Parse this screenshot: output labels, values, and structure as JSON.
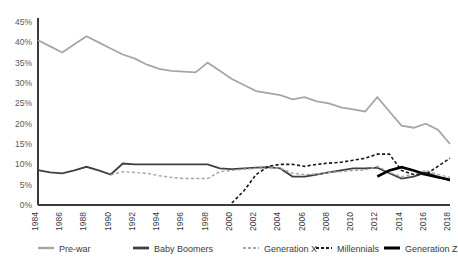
{
  "chart_data": {
    "type": "line",
    "title": "",
    "xlabel": "",
    "ylabel": "",
    "ylim": [
      0,
      45
    ],
    "ytick_labels": [
      "0%",
      "5%",
      "10%",
      "15%",
      "20%",
      "25%",
      "30%",
      "35%",
      "40%",
      "45%"
    ],
    "ytick_values": [
      0,
      5,
      10,
      15,
      20,
      25,
      30,
      35,
      40,
      45
    ],
    "grid": false,
    "legend_position": "bottom",
    "x": [
      1984,
      1985,
      1986,
      1987,
      1988,
      1989,
      1990,
      1991,
      1992,
      1993,
      1994,
      1995,
      1996,
      1997,
      1998,
      1999,
      2000,
      2001,
      2002,
      2003,
      2004,
      2005,
      2006,
      2007,
      2008,
      2009,
      2010,
      2011,
      2012,
      2013,
      2014,
      2015,
      2016,
      2017,
      2018
    ],
    "xtick_labels": [
      "1984",
      "1986",
      "1988",
      "1990",
      "1992",
      "1994",
      "1996",
      "1998",
      "2000",
      "2002",
      "2004",
      "2006",
      "2008",
      "2010",
      "2012",
      "2014",
      "2016",
      "2018"
    ],
    "xtick_values": [
      1984,
      1986,
      1988,
      1990,
      1992,
      1994,
      1996,
      1998,
      2000,
      2002,
      2004,
      2006,
      2008,
      2010,
      2012,
      2014,
      2016,
      2018
    ],
    "series": [
      {
        "name": "Pre-war",
        "color": "#a6a6a6",
        "style": "solid",
        "width": 1.8,
        "x": [
          1984,
          1985,
          1986,
          1987,
          1988,
          1989,
          1990,
          1991,
          1992,
          1993,
          1994,
          1995,
          1996,
          1997,
          1998,
          1999,
          2000,
          2001,
          2002,
          2003,
          2004,
          2005,
          2006,
          2007,
          2008,
          2009,
          2010,
          2011,
          2012,
          2013,
          2014,
          2015,
          2016,
          2017,
          2018
        ],
        "values": [
          40.5,
          39.0,
          37.5,
          39.5,
          41.5,
          40.0,
          38.5,
          37.0,
          36.0,
          34.5,
          33.5,
          33.0,
          32.8,
          32.6,
          35.0,
          33.0,
          31.0,
          29.5,
          28.0,
          27.5,
          27.0,
          26.0,
          26.5,
          25.5,
          25.0,
          24.0,
          23.5,
          23.0,
          26.5,
          23.0,
          19.5,
          19.0,
          20.0,
          18.5,
          15.0
        ]
      },
      {
        "name": "Baby Boomers",
        "color": "#3f3f3f",
        "style": "solid",
        "width": 1.8,
        "x": [
          1984,
          1985,
          1986,
          1987,
          1988,
          1989,
          1990,
          1991,
          1992,
          1993,
          1994,
          1995,
          1996,
          1997,
          1998,
          1999,
          2000,
          2001,
          2002,
          2003,
          2004,
          2005,
          2006,
          2007,
          2008,
          2009,
          2010,
          2011,
          2012,
          2013,
          2014,
          2015,
          2016,
          2017,
          2018
        ],
        "values": [
          8.6,
          8.0,
          7.8,
          8.5,
          9.4,
          8.5,
          7.5,
          10.2,
          10.0,
          10.0,
          10.0,
          10.0,
          10.0,
          10.0,
          10.0,
          9.0,
          8.8,
          9.0,
          9.2,
          9.3,
          9.0,
          7.0,
          7.0,
          7.5,
          8.0,
          8.5,
          9.0,
          9.0,
          9.2,
          7.8,
          6.5,
          7.0,
          8.0,
          7.0,
          6.0
        ]
      },
      {
        "name": "Generation X",
        "color": "#a6a6a6",
        "style": "dashed",
        "width": 1.4,
        "x": [
          1990,
          1991,
          1992,
          1993,
          1994,
          1995,
          1996,
          1997,
          1998,
          1999,
          2000,
          2001,
          2002,
          2003,
          2004,
          2005,
          2006,
          2007,
          2008,
          2009,
          2010,
          2011,
          2012,
          2013,
          2014,
          2015,
          2016,
          2017,
          2018
        ],
        "values": [
          7.4,
          8.2,
          8.0,
          7.8,
          7.2,
          6.8,
          6.5,
          6.5,
          6.5,
          8.2,
          8.5,
          8.8,
          9.0,
          9.2,
          9.0,
          7.8,
          7.5,
          7.6,
          8.0,
          8.2,
          8.5,
          8.6,
          9.5,
          8.0,
          7.0,
          7.5,
          8.5,
          7.5,
          6.8
        ]
      },
      {
        "name": "Millennials",
        "color": "#1a1a1a",
        "style": "dashed",
        "width": 1.6,
        "x": [
          2000,
          2001,
          2002,
          2003,
          2004,
          2005,
          2006,
          2007,
          2008,
          2009,
          2010,
          2011,
          2012,
          2013,
          2014,
          2015,
          2016,
          2017,
          2018
        ],
        "values": [
          0.5,
          3.5,
          7.5,
          9.5,
          10.0,
          10.0,
          9.5,
          10.0,
          10.3,
          10.5,
          11.0,
          11.5,
          12.5,
          12.5,
          8.5,
          7.5,
          7.5,
          9.5,
          11.5
        ]
      },
      {
        "name": "Generation Z",
        "color": "#000000",
        "style": "solid",
        "width": 2.6,
        "x": [
          2012,
          2013,
          2014,
          2015,
          2016,
          2017,
          2018
        ],
        "values": [
          7.0,
          8.5,
          9.3,
          8.5,
          7.5,
          6.8,
          6.2
        ]
      }
    ]
  },
  "legend": {
    "items": [
      {
        "label": "Pre-war",
        "color": "#a6a6a6",
        "style": "solid",
        "width": 2.4
      },
      {
        "label": "Baby Boomers",
        "color": "#3f3f3f",
        "style": "solid",
        "width": 2.8
      },
      {
        "label": "Generation X",
        "color": "#a6a6a6",
        "style": "dashed",
        "width": 2.0
      },
      {
        "label": "Millennials",
        "color": "#1a1a1a",
        "style": "dashed",
        "width": 2.2
      },
      {
        "label": "Generation Z",
        "color": "#000000",
        "style": "solid",
        "width": 3.0
      }
    ]
  },
  "axes": {
    "axis_color": "#3a3a3c",
    "background": "#ffffff"
  }
}
